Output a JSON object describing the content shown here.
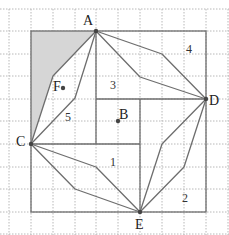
{
  "diagram": {
    "title": "",
    "grid": {
      "x_lines": [
        9,
        31,
        53,
        75,
        96,
        118,
        140,
        162,
        184,
        206,
        228
      ],
      "y_lines": [
        9,
        31,
        54,
        76,
        99,
        121,
        144,
        167,
        189,
        212,
        234
      ]
    },
    "outer_square": {
      "x1": 31,
      "y1": 31,
      "x2": 206,
      "y2": 212
    },
    "points": {
      "A": {
        "label": "A",
        "x": 96,
        "y": 31
      },
      "B": {
        "label": "B",
        "x": 118,
        "y": 121
      },
      "C": {
        "label": "C",
        "x": 31,
        "y": 144
      },
      "D": {
        "label": "D",
        "x": 206,
        "y": 99
      },
      "E": {
        "label": "E",
        "x": 140,
        "y": 212
      },
      "F": {
        "label": "F",
        "x": 63,
        "y": 88
      }
    },
    "region_labels": [
      {
        "text": "1",
        "x": 114,
        "y": 166
      },
      {
        "text": "2",
        "x": 183,
        "y": 202
      },
      {
        "text": "3",
        "x": 114,
        "y": 89
      },
      {
        "text": "4",
        "x": 184,
        "y": 53
      },
      {
        "text": "5",
        "x": 66,
        "y": 120
      }
    ],
    "shaded_region": "31,31 96,31 53,76 31,144",
    "colors": {
      "line": "#6e6e6e",
      "grid": "#b8b8b8",
      "shade": "#d6d6d6",
      "point": "#444444"
    }
  }
}
